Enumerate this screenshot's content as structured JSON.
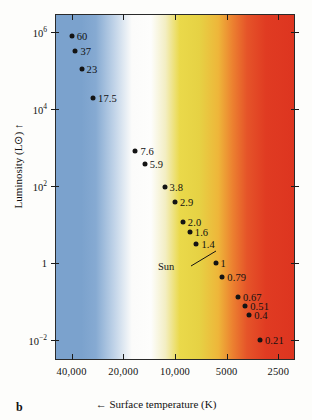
{
  "panel_letter": "b",
  "axes": {
    "x_title": "← Surface temperature (K)",
    "x_title_arrow": "←",
    "x_title_text": "Surface temperature (K)",
    "y_title_text": "Luminosity (L⊙)",
    "y_title_arrow": "↑",
    "x_ticks": [
      "40,000",
      "20,000",
      "10,000",
      "5000",
      "2500"
    ],
    "y_ticks": [
      "10⁶",
      "10⁴",
      "10²",
      "1",
      "10⁻²"
    ]
  },
  "annotation": {
    "sun_label": "Sun"
  },
  "colors": {
    "blue": "#7ba2cd",
    "white": "#fdfdfc",
    "yellow": "#ead94a",
    "orange": "#ec8130",
    "red": "#e03b22",
    "point": "#141414",
    "frame": "#2a2a2a"
  },
  "chart_data": {
    "type": "scatter",
    "title": "",
    "xlabel": "Surface temperature (K)",
    "ylabel": "Luminosity (L⊙)",
    "xscale": "log-reversed",
    "yscale": "log",
    "xlim": [
      50000,
      2000
    ],
    "ylim": [
      0.003,
      3000000
    ],
    "xtick_values": [
      40000,
      20000,
      10000,
      5000,
      2500
    ],
    "xtick_labels": [
      "40,000",
      "20,000",
      "10,000",
      "5000",
      "2500"
    ],
    "ytick_values": [
      1000000,
      10000,
      100,
      1,
      0.01
    ],
    "ytick_labels": [
      "10⁶",
      "10⁴",
      "10²",
      "1",
      "10⁻²"
    ],
    "grid": false,
    "legend": "none",
    "point_label_meaning": "stellar mass in solar masses",
    "points": [
      {
        "label": "60",
        "mass": 60,
        "temperature": 40000,
        "luminosity": 790000
      },
      {
        "label": "37",
        "mass": 37,
        "temperature": 38000,
        "luminosity": 320000
      },
      {
        "label": "23",
        "mass": 23,
        "temperature": 35000,
        "luminosity": 110000
      },
      {
        "label": "17.5",
        "mass": 17.5,
        "temperature": 30000,
        "luminosity": 20000
      },
      {
        "label": "7.6",
        "mass": 7.6,
        "temperature": 17000,
        "luminosity": 830
      },
      {
        "label": "5.9",
        "mass": 5.9,
        "temperature": 15000,
        "luminosity": 380
      },
      {
        "label": "3.8",
        "mass": 3.8,
        "temperature": 11500,
        "luminosity": 93
      },
      {
        "label": "2.9",
        "mass": 2.9,
        "temperature": 10000,
        "luminosity": 39
      },
      {
        "label": "2.0",
        "mass": 2.0,
        "temperature": 9000,
        "luminosity": 12
      },
      {
        "label": "1.6",
        "mass": 1.6,
        "temperature": 8200,
        "luminosity": 6.5
      },
      {
        "label": "1.4",
        "mass": 1.4,
        "temperature": 7500,
        "luminosity": 3.2
      },
      {
        "label": "1",
        "mass": 1.0,
        "temperature": 5800,
        "luminosity": 1.0
      },
      {
        "label": "0.79",
        "mass": 0.79,
        "temperature": 5300,
        "luminosity": 0.42
      },
      {
        "label": "0.67",
        "mass": 0.67,
        "temperature": 4300,
        "luminosity": 0.13
      },
      {
        "label": "0.51",
        "mass": 0.51,
        "temperature": 3900,
        "luminosity": 0.075
      },
      {
        "label": "0.4",
        "mass": 0.4,
        "temperature": 3700,
        "luminosity": 0.044
      },
      {
        "label": "0.21",
        "mass": 0.21,
        "temperature": 3200,
        "luminosity": 0.0098
      }
    ],
    "annotations": [
      {
        "text": "Sun",
        "points_to": "1",
        "type": "leader-line"
      }
    ]
  }
}
